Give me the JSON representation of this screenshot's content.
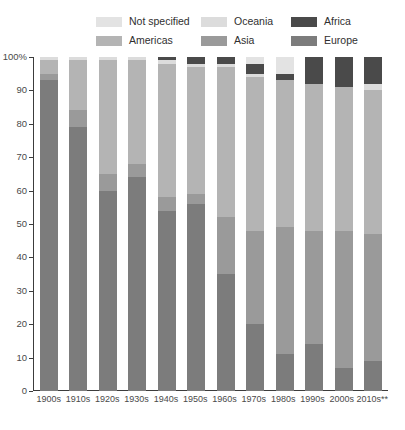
{
  "legend": {
    "rows": [
      [
        {
          "label": "Not specified",
          "color": "#e3e3e3",
          "key": "not_specified"
        },
        {
          "label": "Oceania",
          "color": "#dcdcdc",
          "key": "oceania"
        },
        {
          "label": "Africa",
          "color": "#4a4a4a",
          "key": "africa"
        }
      ],
      [
        {
          "label": "Americas",
          "color": "#b4b4b4",
          "key": "americas"
        },
        {
          "label": "Asia",
          "color": "#9a9a9a",
          "key": "asia"
        },
        {
          "label": "Europe",
          "color": "#7c7c7c",
          "key": "europe"
        }
      ]
    ]
  },
  "axes": {
    "y_ticks": [
      "100%",
      "90",
      "80",
      "70",
      "60",
      "50",
      "40",
      "30",
      "20",
      "10",
      "0"
    ],
    "y_values": [
      100,
      90,
      80,
      70,
      60,
      50,
      40,
      30,
      20,
      10,
      0
    ]
  },
  "chart_data": {
    "type": "bar",
    "subtype": "stacked-percentage",
    "title": "",
    "xlabel": "",
    "ylabel": "",
    "ylim": [
      0,
      100
    ],
    "grid": false,
    "legend_position": "top",
    "categories": [
      "1900s",
      "1910s",
      "1920s",
      "1930s",
      "1940s",
      "1950s",
      "1960s",
      "1970s",
      "1980s",
      "1990s",
      "2000s",
      "2010s**"
    ],
    "series": [
      {
        "name": "Europe",
        "color": "#7c7c7c",
        "values": [
          93,
          79,
          60,
          64,
          54,
          56,
          35,
          20,
          11,
          14,
          7,
          9
        ]
      },
      {
        "name": "Asia",
        "color": "#9a9a9a",
        "values": [
          2,
          5,
          5,
          4,
          4,
          3,
          17,
          28,
          38,
          34,
          41,
          38
        ]
      },
      {
        "name": "Americas",
        "color": "#b4b4b4",
        "values": [
          4,
          15,
          34,
          31,
          40,
          38,
          45,
          46,
          44,
          44,
          43,
          43
        ]
      },
      {
        "name": "Oceania",
        "color": "#dcdcdc",
        "values": [
          1,
          1,
          1,
          1,
          1,
          1,
          1,
          1,
          0,
          0,
          0,
          2
        ]
      },
      {
        "name": "Africa",
        "color": "#4a4a4a",
        "values": [
          0,
          0,
          0,
          0,
          1,
          2,
          2,
          3,
          2,
          8,
          9,
          8
        ]
      },
      {
        "name": "Not specified",
        "color": "#e3e3e3",
        "values": [
          0,
          0,
          0,
          0,
          0,
          0,
          0,
          2,
          5,
          0,
          0,
          0
        ]
      }
    ],
    "stack_order_bottom_to_top": [
      "Europe",
      "Asia",
      "Americas",
      "Oceania",
      "Africa",
      "Not specified"
    ]
  }
}
